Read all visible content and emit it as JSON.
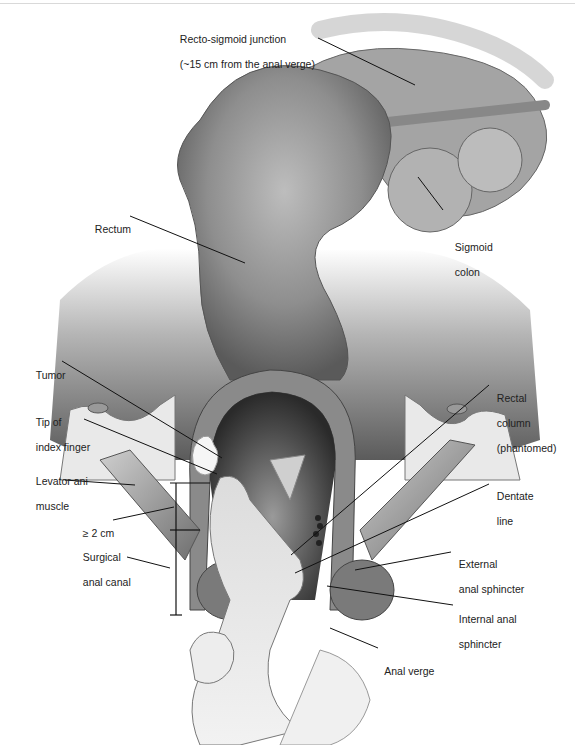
{
  "figure": {
    "type": "anatomical illustration",
    "labels": {
      "rectosigmoid_line1": "Recto-sigmoid junction",
      "rectosigmoid_line2": "(~15 cm from the anal verge)",
      "sigmoid_line1": "Sigmoid",
      "sigmoid_line2": "colon",
      "rectum": "Rectum",
      "tumor": "Tumor",
      "tip_line1": "Tip of",
      "tip_line2": "index finger",
      "levator_line1": "Levator ani",
      "levator_line2": "muscle",
      "distance": "≥ 2 cm",
      "surgical_line1": "Surgical",
      "surgical_line2": "anal canal",
      "rectal_col_line1": "Rectal",
      "rectal_col_line2": "column",
      "rectal_col_line3": "(phantomed)",
      "dentate_line1": "Dentate",
      "dentate_line2": "line",
      "ext_line1": "External",
      "ext_line2": "anal sphincter",
      "int_line1": "Internal anal",
      "int_line2": "sphincter",
      "anal_verge": "Anal verge"
    }
  }
}
